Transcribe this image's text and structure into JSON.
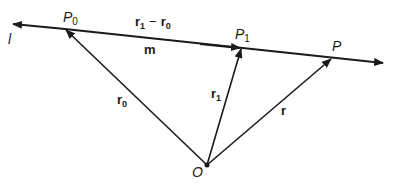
{
  "diagram": {
    "type": "vector-line-diagram",
    "line_label": "l",
    "points": {
      "P0": {
        "label": "P",
        "sub": "0"
      },
      "P1": {
        "label": "P",
        "sub": "1"
      },
      "P": {
        "label": "P",
        "sub": ""
      },
      "O": {
        "label": "O",
        "sub": ""
      }
    },
    "vectors": {
      "r0": {
        "label": "r",
        "sub": "0"
      },
      "r1": {
        "label": "r",
        "sub": "1"
      },
      "r": {
        "label": "r",
        "sub": ""
      },
      "diff": {
        "label_a": "r",
        "sub_a": "1",
        "op": "−",
        "label_b": "r",
        "sub_b": "0"
      },
      "m": {
        "label": "m"
      }
    },
    "colors": {
      "ink": "#1a1a1a",
      "background": "#ffffff"
    }
  }
}
